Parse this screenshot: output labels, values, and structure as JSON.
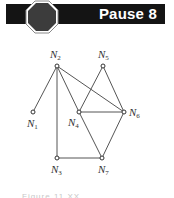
{
  "header": {
    "title": "Pause 8",
    "bar_color": "#141414",
    "text_color": "#ffffff",
    "icon": "stop-octagon-icon",
    "icon_fill": "#3c3c3c",
    "icon_outline": "#ffffff"
  },
  "graph": {
    "nodes": [
      {
        "id": "N1",
        "letter": "N",
        "sub": "1",
        "x": 33,
        "y": 112
      },
      {
        "id": "N2",
        "letter": "N",
        "sub": "2",
        "x": 57,
        "y": 66
      },
      {
        "id": "N3",
        "letter": "N",
        "sub": "3",
        "x": 57,
        "y": 158
      },
      {
        "id": "N4",
        "letter": "N",
        "sub": "4",
        "x": 79,
        "y": 112
      },
      {
        "id": "N5",
        "letter": "N",
        "sub": "5",
        "x": 103,
        "y": 66
      },
      {
        "id": "N6",
        "letter": "N",
        "sub": "6",
        "x": 124,
        "y": 112
      },
      {
        "id": "N7",
        "letter": "N",
        "sub": "7",
        "x": 102,
        "y": 158
      }
    ],
    "edges": [
      [
        "N2",
        "N1"
      ],
      [
        "N2",
        "N3"
      ],
      [
        "N2",
        "N4"
      ],
      [
        "N2",
        "N6"
      ],
      [
        "N5",
        "N4"
      ],
      [
        "N5",
        "N6"
      ],
      [
        "N4",
        "N6"
      ],
      [
        "N4",
        "N7"
      ],
      [
        "N6",
        "N7"
      ],
      [
        "N3",
        "N7"
      ]
    ],
    "edge_color": "#555555"
  },
  "caption": {
    "text": "Figure 11.XX"
  }
}
